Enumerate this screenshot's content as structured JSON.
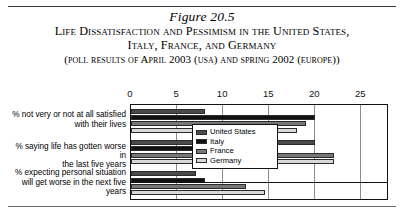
{
  "figure": {
    "number": "Figure 20.5",
    "title_line1": "Life Dissatisfaction and Pessimism in the United States,",
    "title_line2": "Italy, France, and Germany",
    "subtitle": "(poll results of April 2003 (usa) and spring 2002 (europe))"
  },
  "chart_data": {
    "type": "bar",
    "orientation": "horizontal",
    "title": "Life Dissatisfaction and Pessimism in the United States, Italy, France, and Germany",
    "subtitle": "(poll results of April 2003 (USA) and spring 2002 (Europe))",
    "categories": [
      "% not very or not at all satisfied with their lives",
      "% saying life has gotten worse in the last five years",
      "% expecting personal situation will get worse in the next five years"
    ],
    "category_lines": [
      [
        "% not very or not at all satisfied",
        "with their lives"
      ],
      [
        "% saying life has gotten worse in",
        "the last five years"
      ],
      [
        "% expecting personal situation",
        "will get worse in the next five",
        "years"
      ]
    ],
    "series": [
      {
        "name": "United States",
        "color": "#4a4a4a",
        "values": [
          8,
          20,
          7
        ]
      },
      {
        "name": "Italy",
        "color": "#111111",
        "values": [
          20,
          14,
          8
        ]
      },
      {
        "name": "France",
        "color": "#777777",
        "values": [
          19,
          22,
          12.5
        ]
      },
      {
        "name": "Germany",
        "color": "#d8d8d8",
        "values": [
          18,
          22,
          14.5
        ]
      }
    ],
    "xlabel": "",
    "ylabel": "",
    "xlim": [
      0,
      28
    ],
    "xticks": [
      0,
      5,
      10,
      15,
      20,
      25
    ],
    "tick_labels": [
      "0",
      "5",
      "10",
      "15",
      "20",
      "25"
    ],
    "grid": true,
    "legend_position": "right-top"
  }
}
